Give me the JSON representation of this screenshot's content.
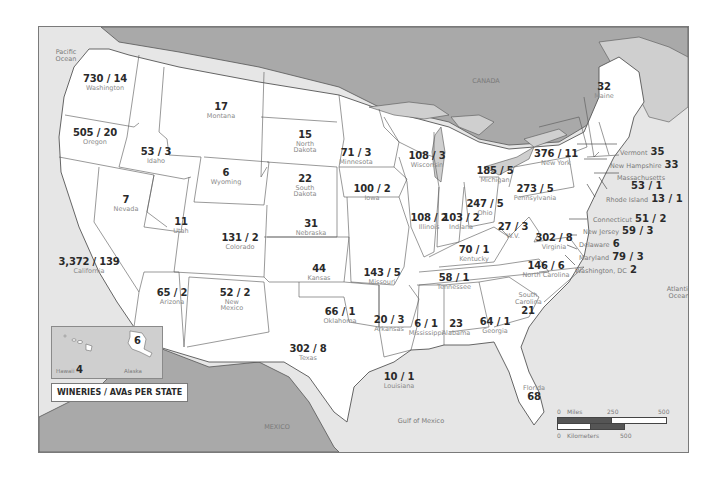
{
  "map": {
    "title": "WINERIES / AVAs PER STATE",
    "colors": {
      "land_us": "#ffffff",
      "land_foreign": "#a9a9a9",
      "water": "#e6e6e6",
      "border": "#555555",
      "frame": "#7a7a7a"
    },
    "geo_labels": {
      "pacific": "Pacific\nOcean",
      "canada": "CANADA",
      "atlantic": "Atlantic\nOcean",
      "gulf": "Gulf of Mexico",
      "mexico": "MEXICO"
    },
    "states": [
      {
        "name": "Washington",
        "value": "730 / 14"
      },
      {
        "name": "Oregon",
        "value": "505 / 20"
      },
      {
        "name": "California",
        "value": "3,372 / 139"
      },
      {
        "name": "Idaho",
        "value": "53 / 3"
      },
      {
        "name": "Nevada",
        "value": "7"
      },
      {
        "name": "Montana",
        "value": "17"
      },
      {
        "name": "Wyoming",
        "value": "6"
      },
      {
        "name": "Utah",
        "value": "11"
      },
      {
        "name": "Colorado",
        "value": "131 / 2"
      },
      {
        "name": "Arizona",
        "value": "65 / 2"
      },
      {
        "name": "New Mexico",
        "value": "52 / 2"
      },
      {
        "name": "North Dakota",
        "value": "15"
      },
      {
        "name": "South Dakota",
        "value": "22"
      },
      {
        "name": "Nebraska",
        "value": "31"
      },
      {
        "name": "Kansas",
        "value": "44"
      },
      {
        "name": "Oklahoma",
        "value": "66 / 1"
      },
      {
        "name": "Texas",
        "value": "302 / 8"
      },
      {
        "name": "Minnesota",
        "value": "71 / 3"
      },
      {
        "name": "Iowa",
        "value": "100 / 2"
      },
      {
        "name": "Missouri",
        "value": "143 / 5"
      },
      {
        "name": "Arkansas",
        "value": "20 / 3"
      },
      {
        "name": "Louisiana",
        "value": "10 / 1"
      },
      {
        "name": "Wisconsin",
        "value": "108 / 3"
      },
      {
        "name": "Illinois",
        "value": "108 / 2"
      },
      {
        "name": "Michigan",
        "value": "185 / 5"
      },
      {
        "name": "Indiana",
        "value": "103 / 2"
      },
      {
        "name": "Ohio",
        "value": "247 / 5"
      },
      {
        "name": "Kentucky",
        "value": "70 / 1"
      },
      {
        "name": "Tennessee",
        "value": "58 / 1"
      },
      {
        "name": "Mississippi",
        "value": "6 / 1"
      },
      {
        "name": "Alabama",
        "value": "23"
      },
      {
        "name": "Georgia",
        "value": "64 / 1"
      },
      {
        "name": "Florida",
        "value": "68"
      },
      {
        "name": "South Carolina",
        "value": "21"
      },
      {
        "name": "North Carolina",
        "value": "146 / 6"
      },
      {
        "name": "Virginia",
        "value": "302 / 8"
      },
      {
        "name": "W.V.",
        "value": "27 / 3"
      },
      {
        "name": "Pennsylvania",
        "value": "273 / 5"
      },
      {
        "name": "New York",
        "value": "376 / 11"
      },
      {
        "name": "Maine",
        "value": "32"
      }
    ],
    "northeast_callouts": [
      {
        "name": "Vermont",
        "value": "35"
      },
      {
        "name": "New Hampshire",
        "value": "33"
      },
      {
        "name": "Massachusetts",
        "value": "53 / 1"
      },
      {
        "name": "Rhode Island",
        "value": "13 / 1"
      },
      {
        "name": "Connecticut",
        "value": "51 / 2"
      },
      {
        "name": "New Jersey",
        "value": "59 / 3"
      },
      {
        "name": "Delaware",
        "value": "6"
      },
      {
        "name": "Maryland",
        "value": "79 / 3"
      },
      {
        "name": "Washington, DC",
        "value": "2"
      }
    ],
    "inset": {
      "hawaii": {
        "name": "Hawaii",
        "value": "4"
      },
      "alaska": {
        "name": "Alaska",
        "value": "6"
      }
    },
    "scale": {
      "miles_label": "Miles",
      "km_label": "Kilometers",
      "zero": "0",
      "m250": "250",
      "m500": "500",
      "k500": "500"
    }
  }
}
